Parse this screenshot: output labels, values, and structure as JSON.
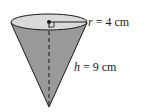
{
  "figure": {
    "shape": "cone",
    "radius_label": {
      "var": "r",
      "text": " = 4 cm"
    },
    "height_label": {
      "var": "h",
      "text": " = 9 cm"
    },
    "colors": {
      "cone_side": "#9a9a9a",
      "top_ellipse": "#d9d9d9",
      "stroke": "#1a1a1a"
    }
  }
}
